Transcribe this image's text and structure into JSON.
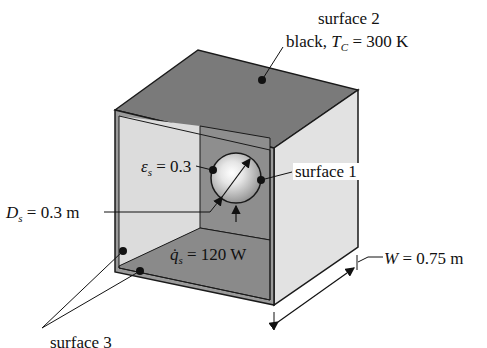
{
  "figure": {
    "type": "enclosure radiation schematic",
    "colors": {
      "top_face": "#7a7a7a",
      "right_face": "#e2e2e2",
      "inner_side_wall": "#dcdcdc",
      "inner_back_wall": "#8e8e8e",
      "inner_floor": "#8a8a8a",
      "edge": "#1a1a1a",
      "sphere_highlight": "#ffffff",
      "sphere_shade": "#9a9a9a"
    }
  },
  "labels": {
    "surface2_line1": "surface 2",
    "surface2_line2_prefix": "black, ",
    "surface2_T": "T",
    "surface2_T_sub": "C",
    "surface2_value": " = 300 K",
    "surface1": "surface 1",
    "surface3": "surface 3",
    "emissivity_symbol": "ε",
    "emissivity_sub": "s",
    "emissivity_value": " = 0.3",
    "diameter_symbol": "D",
    "diameter_sub": "s",
    "diameter_value": " = 0.3 m",
    "heat_symbol": "q̇",
    "heat_sub": "s",
    "heat_value": " = 120 W",
    "width_symbol": "W",
    "width_value": " = 0.75 m"
  }
}
